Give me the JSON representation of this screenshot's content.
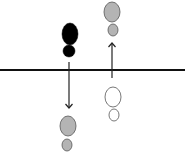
{
  "diagram": {
    "type": "cell-division-schematic",
    "colors": {
      "black": "#000000",
      "gray": "#b4b4b4",
      "outline": "#555555",
      "white": "#ffffff",
      "line": "#111111",
      "arrow": "#222222"
    },
    "baseline": {
      "y": 70,
      "x1": 0,
      "x2": 185
    },
    "figures": [
      {
        "name": "black-cell-top-left",
        "fill": "black",
        "big": [
          70,
          34,
          8,
          11
        ],
        "small": [
          69,
          51,
          6,
          6
        ]
      },
      {
        "name": "gray-cell-bottom-left",
        "fill": "gray",
        "big": [
          68,
          126,
          8,
          10
        ],
        "small": [
          67,
          145,
          5,
          6
        ]
      },
      {
        "name": "gray-cell-top-right",
        "fill": "gray",
        "big": [
          112,
          12,
          8,
          10
        ],
        "small": [
          113,
          30,
          5,
          6
        ]
      },
      {
        "name": "white-cell-bottom-right",
        "fill": "white",
        "big": [
          113,
          97,
          8,
          10
        ],
        "small": [
          114,
          115,
          5,
          6
        ]
      }
    ],
    "arrows": [
      {
        "name": "down-arrow",
        "x": 69,
        "y1": 62,
        "y2": 108,
        "direction": "down"
      },
      {
        "name": "up-arrow",
        "x": 112,
        "y1": 78,
        "y2": 43,
        "direction": "up"
      }
    ]
  }
}
